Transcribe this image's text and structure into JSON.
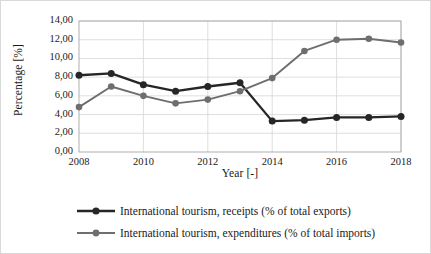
{
  "chart_data": {
    "type": "line",
    "title": "",
    "xlabel": "Year [-]",
    "ylabel": "Percentage [%]",
    "x": [
      2008,
      2009,
      2010,
      2011,
      2012,
      2013,
      2014,
      2015,
      2016,
      2017,
      2018
    ],
    "xtick_labels": [
      "2008",
      "2010",
      "2012",
      "2014",
      "2016",
      "2018"
    ],
    "xtick_values": [
      2008,
      2010,
      2012,
      2014,
      2016,
      2018
    ],
    "ytick_labels": [
      "14,00",
      "12,00",
      "10,00",
      "8,00",
      "6,00",
      "4,00",
      "2,00",
      "0,00"
    ],
    "ytick_values": [
      14,
      12,
      10,
      8,
      6,
      4,
      2,
      0
    ],
    "xlim": [
      2008,
      2018
    ],
    "ylim": [
      0,
      14
    ],
    "grid": "horizontal-and-vertical",
    "legend_position": "bottom",
    "series": [
      {
        "name": "International tourism, receipts (% of total exports)",
        "color": "#262626",
        "marker": "circle",
        "values": [
          8.2,
          8.4,
          7.2,
          6.5,
          7.0,
          7.4,
          3.3,
          3.4,
          3.7,
          3.7,
          3.8
        ]
      },
      {
        "name": "International tourism, expenditures (% of total imports)",
        "color": "#6e6e6e",
        "marker": "circle",
        "values": [
          4.8,
          7.0,
          6.0,
          5.2,
          5.6,
          6.5,
          7.9,
          10.8,
          12.0,
          12.1,
          11.7
        ]
      }
    ]
  },
  "figure": {
    "border_color": "#d9d9d9",
    "background": "#ffffff",
    "grid_color": "#d6d6d6",
    "axis_color": "#a6a6a6",
    "text_color": "#1a1a1a"
  }
}
